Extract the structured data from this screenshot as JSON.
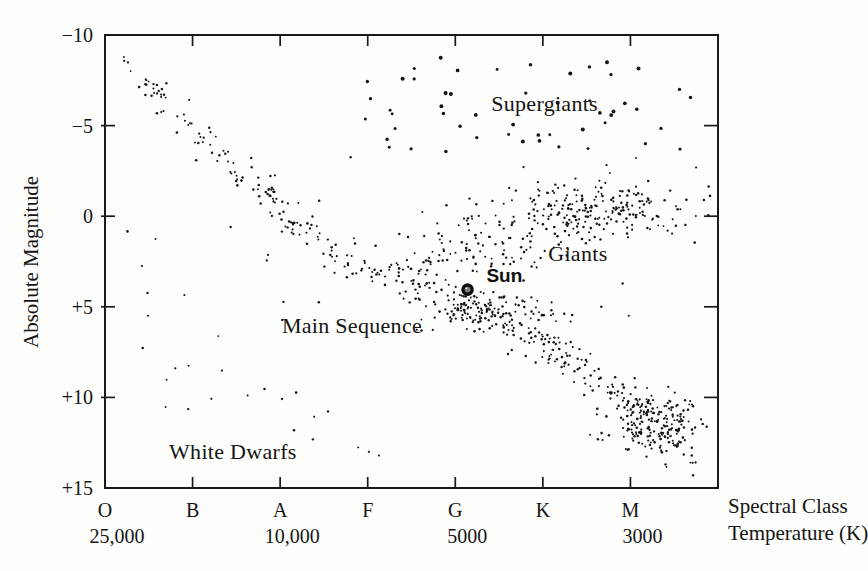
{
  "chart_data": {
    "type": "scatter",
    "title": "",
    "ylabel": "Absolute Magnitude",
    "xlabel_right_line1": "Spectral Class",
    "xlabel_right_line2": "Temperature (K)",
    "background_color": "#fdfdfb",
    "ink_color": "#141414",
    "y_axis": {
      "range": [
        -10,
        15
      ],
      "inverted_display": true,
      "ticks": [
        {
          "label": "−10",
          "value": -10
        },
        {
          "label": "−5",
          "value": -5
        },
        {
          "label": "0",
          "value": 0
        },
        {
          "label": "+5",
          "value": 5
        },
        {
          "label": "+10",
          "value": 10
        },
        {
          "label": "+15",
          "value": 15
        }
      ]
    },
    "x_axis": {
      "range_index": [
        0,
        7
      ],
      "ticks": [
        {
          "label": "O",
          "xi": 0,
          "temperature": "25,000"
        },
        {
          "label": "B",
          "xi": 1,
          "temperature": null
        },
        {
          "label": "A",
          "xi": 2,
          "temperature": "10,000"
        },
        {
          "label": "F",
          "xi": 3,
          "temperature": null
        },
        {
          "label": "G",
          "xi": 4,
          "temperature": "5000"
        },
        {
          "label": "K",
          "xi": 5,
          "temperature": null
        },
        {
          "label": "M",
          "xi": 6,
          "temperature": "3000"
        }
      ]
    },
    "region_labels": [
      {
        "name": "supergiants",
        "text": "Supergiants",
        "xi": 5.02,
        "magnitude": -6.25
      },
      {
        "name": "giants",
        "text": "Giants",
        "xi": 5.4,
        "magnitude": 2.05
      },
      {
        "name": "main-sequence",
        "text": "Main Sequence",
        "xi": 2.82,
        "magnitude": 6.0
      },
      {
        "name": "white-dwarfs",
        "text": "White Dwarfs",
        "xi": 1.46,
        "magnitude": 12.95
      }
    ],
    "sun": {
      "label": "Sun",
      "xi": 4.14,
      "magnitude": 4.05,
      "label_xi": 4.56,
      "label_magnitude": 3.28,
      "marker_radius": 6.3
    },
    "point_style": {
      "color": "#141414",
      "radius": 1.1,
      "supergiant_radius": 1.7
    },
    "seed": 42,
    "regions": [
      {
        "name": "main-sequence-band",
        "kind": "curve_band",
        "count": 420,
        "t_exponent": 0.75,
        "sigma_mag_base": 0.42,
        "sigma_mag_growth": 0.25,
        "sigma_xi": 0.07,
        "curve": [
          [
            0,
            -9.7
          ],
          [
            0.5,
            -7.2
          ],
          [
            1.1,
            -4.3
          ],
          [
            1.7,
            -1.8
          ],
          [
            2.25,
            0.7
          ],
          [
            2.8,
            2.6
          ],
          [
            3.4,
            3.8
          ],
          [
            4.0,
            4.6
          ],
          [
            4.5,
            5.6
          ],
          [
            5.1,
            7.3
          ],
          [
            5.65,
            9.2
          ],
          [
            6.2,
            11.1
          ],
          [
            6.7,
            13.1
          ]
        ]
      },
      {
        "name": "fg-knot",
        "kind": "gauss",
        "count": 110,
        "center": [
          4.45,
          5.35
        ],
        "sigma": [
          0.4,
          0.6
        ]
      },
      {
        "name": "m-knot",
        "kind": "gauss",
        "count": 150,
        "center": [
          6.3,
          11.3
        ],
        "sigma": [
          0.32,
          0.9
        ]
      },
      {
        "name": "giants",
        "kind": "gauss",
        "count": 205,
        "center": [
          5.62,
          -0.4
        ],
        "sigma": [
          0.58,
          0.75
        ]
      },
      {
        "name": "subgiant-bridge",
        "kind": "line_band",
        "count": 130,
        "from": [
          3.55,
          2.9
        ],
        "to": [
          5.45,
          -0.1
        ],
        "sigma_xi": 0.15,
        "sigma_mag": 1.0
      },
      {
        "name": "supergiants",
        "kind": "box",
        "count": 52,
        "x_range": [
          2.95,
          6.92
        ],
        "mag_range": [
          -8.8,
          -3.55
        ],
        "radius": 1.7
      },
      {
        "name": "white-dwarfs",
        "kind": "line_band",
        "count": 18,
        "from": [
          0.45,
          7.7
        ],
        "to": [
          3.35,
          13.6
        ],
        "sigma_xi": 0.18,
        "sigma_mag": 0.9
      },
      {
        "name": "field-stars",
        "kind": "box",
        "count": 40,
        "x_range": [
          0.25,
          6.9
        ],
        "mag_range": [
          -3.3,
          7.3
        ]
      }
    ],
    "extra_points": [
      [
        4.78,
        3.55
      ]
    ]
  }
}
